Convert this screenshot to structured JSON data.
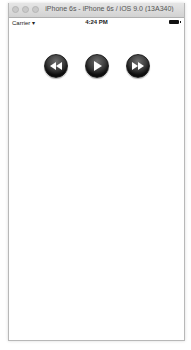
{
  "window": {
    "title": "iPhone 6s - iPhone 6s / iOS 9.0 (13A340)"
  },
  "status_bar": {
    "carrier": "Carrier",
    "wifi_icon": "wifi-icon",
    "time": "4:24 PM",
    "battery_icon": "battery-icon"
  },
  "controls": {
    "buttons": [
      {
        "name": "rewind",
        "icon": "rewind-icon"
      },
      {
        "name": "play",
        "icon": "play-icon"
      },
      {
        "name": "fast-forward",
        "icon": "fast-forward-icon"
      }
    ]
  }
}
